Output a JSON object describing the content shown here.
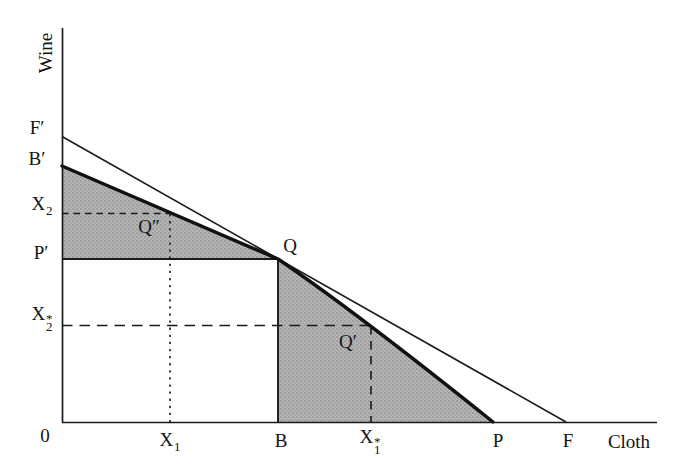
{
  "figure_labels": {
    "wine": "Wine",
    "cloth": "Cloth",
    "origin": "0",
    "f_prime": "F′",
    "b_prime": "B′",
    "p_prime": "P′",
    "b": "B",
    "p": "P",
    "f": "F",
    "q": "Q",
    "q_prime": "Q′",
    "q_double_prime": "Q″",
    "x1": {
      "base": "X",
      "sub": "1"
    },
    "x2": {
      "base": "X",
      "sub": "2"
    },
    "x1_star": {
      "base": "X",
      "sup": "*",
      "sub": "1"
    },
    "x2_star": {
      "base": "X",
      "sup": "*",
      "sub": "2"
    }
  },
  "colors": {
    "ink": "#1a1a1a",
    "shade_base": "#b5b5b5",
    "shade_dot": "#969696",
    "background": "#ffffff"
  }
}
